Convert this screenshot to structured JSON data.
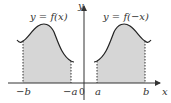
{
  "diagram": {
    "left_graph": {
      "equation": "y = f(x)",
      "tick_left": "−b",
      "tick_right": "−a"
    },
    "right_graph": {
      "equation": "y = f(−x)",
      "tick_left": "a",
      "tick_right": "b"
    },
    "axes": {
      "x_label": "x",
      "y_label": "y",
      "origin_label": "0"
    },
    "colors": {
      "fill": "#d6d6d6",
      "curve": "#222222",
      "axis": "#333333"
    }
  }
}
